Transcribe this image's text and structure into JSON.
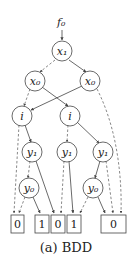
{
  "diagram": {
    "root_label": "f₀",
    "caption": "(a) BDD",
    "nodes": [
      {
        "id": "x1",
        "label": "x₁"
      },
      {
        "id": "x0a",
        "label": "x₀"
      },
      {
        "id": "x0b",
        "label": "x₀"
      },
      {
        "id": "ia",
        "label": "i"
      },
      {
        "id": "ib",
        "label": "i"
      },
      {
        "id": "y1a",
        "label": "y₁"
      },
      {
        "id": "y1b",
        "label": "y₁"
      },
      {
        "id": "y1c",
        "label": "y₁"
      },
      {
        "id": "y0a",
        "label": "y₀"
      },
      {
        "id": "y0b",
        "label": "y₀"
      }
    ],
    "terminals": [
      {
        "id": "t0a",
        "label": "0"
      },
      {
        "id": "t1a",
        "label": "1"
      },
      {
        "id": "t0b",
        "label": "0"
      },
      {
        "id": "t1b",
        "label": "1"
      },
      {
        "id": "t0c",
        "label": "0"
      }
    ],
    "edges": [
      {
        "from": "x1",
        "to": "x0a",
        "style": "dashed"
      },
      {
        "from": "x1",
        "to": "x0b",
        "style": "solid"
      },
      {
        "from": "x0a",
        "to": "ia",
        "style": "dashed"
      },
      {
        "from": "x0a",
        "to": "ib",
        "style": "solid"
      },
      {
        "from": "x0b",
        "to": "ia",
        "style": "solid"
      },
      {
        "from": "x0b",
        "to": "t0c",
        "style": "dashed"
      },
      {
        "from": "ia",
        "to": "t0a",
        "style": "dashed"
      },
      {
        "from": "ia",
        "to": "y1a",
        "style": "solid"
      },
      {
        "from": "ib",
        "to": "y1b",
        "style": "dashed"
      },
      {
        "from": "ib",
        "to": "y1c",
        "style": "solid"
      },
      {
        "from": "y1a",
        "to": "y0a",
        "style": "dashed"
      },
      {
        "from": "y1a",
        "to": "t0b",
        "style": "solid"
      },
      {
        "from": "y1b",
        "to": "t0b",
        "style": "dashed"
      },
      {
        "from": "y1b",
        "to": "t1b",
        "style": "solid"
      },
      {
        "from": "y1c",
        "to": "y0b",
        "style": "solid"
      },
      {
        "from": "y1c",
        "to": "t0c",
        "style": "dashed"
      },
      {
        "from": "y0a",
        "to": "t0a",
        "style": "dashed"
      },
      {
        "from": "y0a",
        "to": "t1a",
        "style": "solid"
      },
      {
        "from": "y0b",
        "to": "t1b",
        "style": "dashed"
      },
      {
        "from": "y0b",
        "to": "t0c",
        "style": "solid"
      }
    ]
  }
}
